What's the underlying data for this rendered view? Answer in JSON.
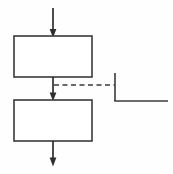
{
  "diagram": {
    "type": "flowchart",
    "title": "",
    "canvas": {
      "width": 173,
      "height": 174,
      "background": "#fefefe"
    },
    "stroke_color": "#3a3a3a",
    "arrow_color": "#2e2e2e",
    "nodes": [
      {
        "id": "process-box-top",
        "shape": "rectangle",
        "label": "",
        "x": 14,
        "y": 36,
        "width": 78,
        "height": 41
      },
      {
        "id": "process-box-bottom",
        "shape": "rectangle",
        "label": "",
        "x": 14,
        "y": 100,
        "width": 78,
        "height": 41
      }
    ],
    "connectors": [
      {
        "id": "inbound-arrow",
        "style": "solid-arrow",
        "from": {
          "x": 53,
          "y": 8
        },
        "to": {
          "x": 53,
          "y": 36
        },
        "label": ""
      },
      {
        "id": "between-boxes-arrow",
        "style": "solid-arrow",
        "from": {
          "x": 53,
          "y": 77
        },
        "to": {
          "x": 53,
          "y": 100
        },
        "label": ""
      },
      {
        "id": "outbound-arrow",
        "style": "solid-arrow",
        "from": {
          "x": 53,
          "y": 141
        },
        "to": {
          "x": 53,
          "y": 166
        },
        "label": ""
      },
      {
        "id": "dashed-association",
        "style": "dashed",
        "from": {
          "x": 53,
          "y": 85
        },
        "to": {
          "x": 115,
          "y": 85
        },
        "label": ""
      }
    ],
    "annotations": [
      {
        "id": "side-bracket",
        "style": "bracket",
        "vertical": {
          "x": 115,
          "y1": 73,
          "y2": 101
        },
        "horizontal": {
          "y": 101,
          "x1": 115,
          "x2": 168
        },
        "label": ""
      }
    ]
  }
}
